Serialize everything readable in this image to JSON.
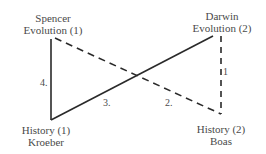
{
  "nodes": {
    "spencer": {
      "line1": "Spencer",
      "line2": "Evolution (1)"
    },
    "darwin": {
      "line1": "Darwin",
      "line2": "Evolution (2)"
    },
    "kroeber": {
      "line1": "History (1)",
      "line2": "Kroeber"
    },
    "boas": {
      "line1": "History (2)",
      "line2": "Boas"
    }
  },
  "edges": [
    {
      "label": "1",
      "from": "darwin",
      "to": "boas",
      "style": "dashed"
    },
    {
      "label": "2.",
      "from": "spencer",
      "to": "boas",
      "style": "dashed"
    },
    {
      "label": "3.",
      "from": "kroeber",
      "to": "darwin",
      "style": "solid"
    },
    {
      "label": "4.",
      "from": "spencer",
      "to": "kroeber",
      "style": "solid"
    }
  ],
  "colors": {
    "line": "#2a2a2a",
    "text": "#4a4a4a"
  }
}
